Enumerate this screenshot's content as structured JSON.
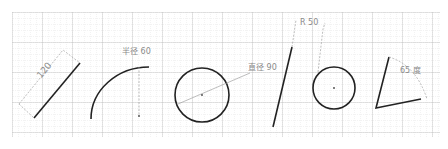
{
  "diagram": {
    "colors": {
      "grid_minor": "#d8d8d8",
      "grid_major": "#b0b0b0",
      "shape": "#222222",
      "dimension": "#9a9a9a",
      "background": "#ffffff"
    },
    "shapes": [
      {
        "type": "line",
        "name": "length-line",
        "dimension_label": "120"
      },
      {
        "type": "arc",
        "name": "radius-arc",
        "dimension_label": "半径 60"
      },
      {
        "type": "circle",
        "name": "diameter-circle",
        "dimension_label": "直径 90"
      },
      {
        "type": "line",
        "name": "steep-line"
      },
      {
        "type": "circle",
        "name": "radius-circle",
        "dimension_label": "R 50"
      },
      {
        "type": "angle",
        "name": "angle-shape",
        "dimension_label": "65 度"
      }
    ]
  }
}
